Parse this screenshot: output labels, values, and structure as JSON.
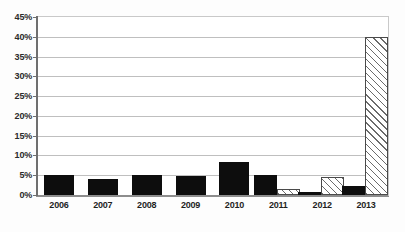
{
  "chart_data": {
    "type": "bar",
    "title": "",
    "subtitle": "",
    "xlabel": "",
    "ylabel": "",
    "categories": [
      "2006",
      "2007",
      "2008",
      "2009",
      "2010",
      "2011",
      "2012",
      "2013"
    ],
    "series": [
      {
        "name": "series-solid-black",
        "fill": "solid-black",
        "color": "#0d0d0d",
        "values": [
          5.0,
          4.0,
          5.1,
          4.9,
          8.3,
          5.2,
          0.7,
          2.4
        ]
      },
      {
        "name": "series-hatched",
        "fill": "diagonal-hatch",
        "color": "#6b6b6b",
        "values": [
          null,
          null,
          null,
          null,
          null,
          1.5,
          4.7,
          40.2
        ]
      }
    ],
    "ylim": [
      0,
      45
    ],
    "ytick_step": 5,
    "ytick_labels": [
      "0%",
      "5%",
      "10%",
      "15%",
      "20%",
      "25%",
      "30%",
      "35%",
      "40%",
      "45%"
    ],
    "ytick_values": [
      0,
      5,
      10,
      15,
      20,
      25,
      30,
      35,
      40,
      45
    ],
    "grid": true,
    "grid_axis": "y",
    "legend": false,
    "legend_position": "none",
    "annotations": []
  },
  "colors": {
    "background": "#ffffff",
    "gridline": "#bfbfbf",
    "axis": "#6f6f6f",
    "frame": "#c9c9c9",
    "bar_solid": "#0d0d0d",
    "bar_hatch_line": "#6b6b6b",
    "bar_hatch_border": "#4a4a4a",
    "tick_text": "#2b2b2b"
  }
}
